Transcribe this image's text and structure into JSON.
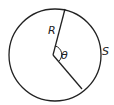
{
  "diagram": {
    "circle": {
      "cx": 55,
      "cy": 55,
      "r": 46,
      "stroke": "#222222"
    },
    "center": {
      "x": 53,
      "y": 55
    },
    "radius_end_top": {
      "x": 65,
      "y": 9
    },
    "radius_end_bottom": {
      "x": 82,
      "y": 89
    },
    "labels": {
      "radius": "R",
      "angle": "θ",
      "arc": "S"
    }
  }
}
